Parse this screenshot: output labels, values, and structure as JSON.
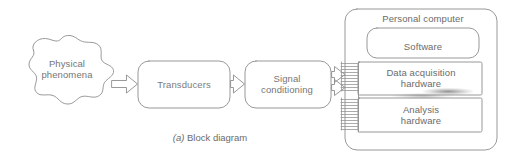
{
  "figure": {
    "caption_tag": "(a)",
    "caption_text": "Block diagram",
    "background_color": "#ffffff",
    "line_color": "#8a8a8a",
    "text_color": "#6f6f6f"
  },
  "nodes": {
    "source": {
      "label": "Physical\nphenomena",
      "shape": "blob"
    },
    "transducers": {
      "label": "Transducers",
      "shape": "rounded-rect"
    },
    "signal_conditioning": {
      "label": "Signal\nconditioning",
      "shape": "rounded-rect"
    },
    "personal_computer": {
      "label": "Personal computer",
      "shape": "rounded-rect-container",
      "children": [
        {
          "label": "Software",
          "shape": "rounded-rect"
        },
        {
          "label": "Data acquisition\nhardware",
          "shape": "rect"
        },
        {
          "label": "Analysis\nhardware",
          "shape": "rect"
        }
      ]
    }
  },
  "connectors": [
    {
      "name": "phenomena-to-transducers",
      "style": "block-arrow",
      "direction": "right"
    },
    {
      "name": "transducers-to-signal-conditioning",
      "style": "block-arrow",
      "direction": "right"
    },
    {
      "name": "signal-conditioning-to-daq",
      "style": "block-arrow",
      "direction": "right"
    },
    {
      "name": "signal-conditioning-to-analysis",
      "style": "block-arrow",
      "direction": "right"
    },
    {
      "name": "daq-bus-ribbon",
      "style": "ribbon-lines"
    },
    {
      "name": "analysis-bus-ribbon",
      "style": "ribbon-lines"
    }
  ]
}
